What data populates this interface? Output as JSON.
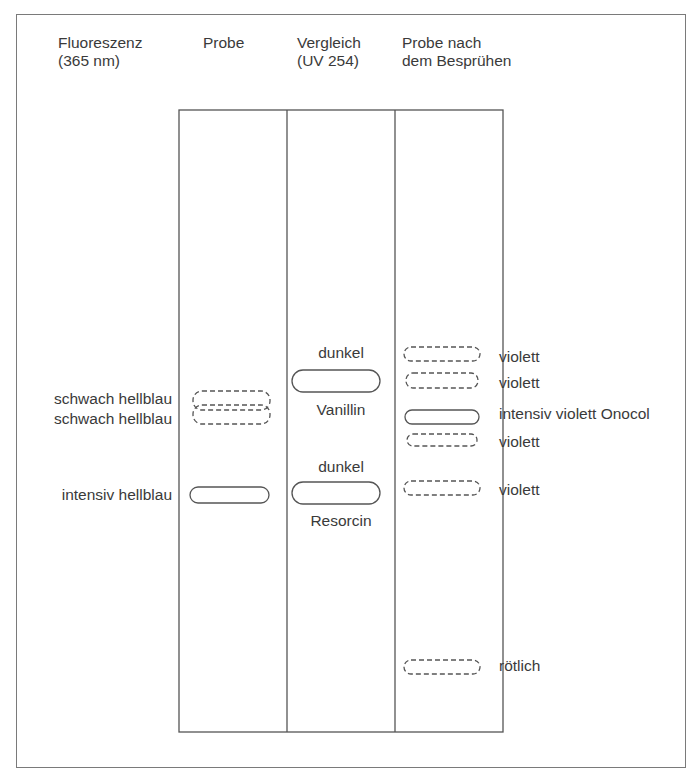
{
  "headers": {
    "fluorescence": [
      "Fluoreszenz",
      "(365 nm)"
    ],
    "sample": "Probe",
    "reference": [
      "Vergleich",
      "(UV 254)"
    ],
    "sprayed": [
      "Probe nach",
      "dem Besprühen"
    ]
  },
  "left_labels": [
    {
      "text": "schwach hellblau"
    },
    {
      "text": "schwach hellblau"
    },
    {
      "text": "intensiv hellblau"
    }
  ],
  "reference_labels": {
    "vanillin_top": "dunkel",
    "vanillin_name": "Vanillin",
    "resorcin_top": "dunkel",
    "resorcin_name": "Resorcin"
  },
  "right_labels": [
    {
      "text": "violett"
    },
    {
      "text": "violett"
    },
    {
      "text": "intensiv violett Onocol"
    },
    {
      "text": "violett"
    },
    {
      "text": "violett"
    },
    {
      "text": "rötlich"
    }
  ],
  "colors": {
    "line": "#555555",
    "frame": "#7a7a7a",
    "text": "#3a3a3a"
  }
}
